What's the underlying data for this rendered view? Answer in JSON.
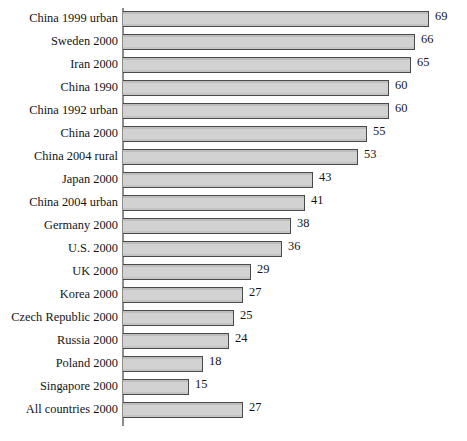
{
  "chart_data": {
    "type": "bar",
    "orientation": "horizontal",
    "title": "",
    "subtitle": "",
    "xlabel": "",
    "ylabel": "",
    "xlim": [
      0,
      69
    ],
    "grid": false,
    "legend": null,
    "axis_line": "vertical-left",
    "bar_fill_color": "#cccccc",
    "bar_border_color": "#4a4a4a",
    "axis_color": "#8c8c8c",
    "text_color": "#141414",
    "show_value_labels": true,
    "categories": [
      "China 1999 urban",
      "Sweden 2000",
      "Iran 2000",
      "China 1990",
      "China 1992 urban",
      "China 2000",
      "China 2004 rural",
      "Japan 2000",
      "China 2004 urban",
      "Germany 2000",
      "U.S. 2000",
      "UK 2000",
      "Korea 2000",
      "Czech Republic 2000",
      "Russia 2000",
      "Poland 2000",
      "Singapore 2000",
      "All countries 2000"
    ],
    "values": [
      69,
      66,
      65,
      60,
      60,
      55,
      53,
      43,
      41,
      38,
      36,
      29,
      27,
      25,
      24,
      18,
      15,
      27
    ],
    "value_labels": [
      "69",
      "66",
      "65",
      "60",
      "60",
      "55",
      "53",
      "43",
      "41",
      "38",
      "36",
      "29",
      "27",
      "25",
      "24",
      "18",
      "15",
      "27"
    ]
  }
}
